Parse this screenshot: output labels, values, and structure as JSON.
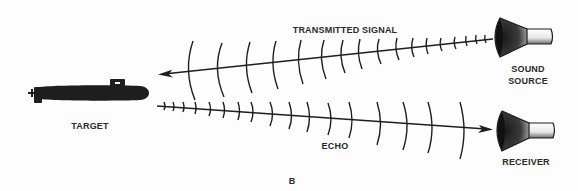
{
  "diagram": {
    "type": "sonar-echo-ranging",
    "panel_label": "B",
    "labels": {
      "transmitted_signal": "TRANSMITTED SIGNAL",
      "sound_source_line1": "SOUND",
      "sound_source_line2": "SOURCE",
      "target": "TARGET",
      "echo": "ECHO",
      "receiver": "RECEIVER"
    },
    "nodes": [
      {
        "id": "target",
        "label": "TARGET",
        "icon": "submarine-icon"
      },
      {
        "id": "sound_source",
        "label": "SOUND SOURCE",
        "icon": "transducer-icon"
      },
      {
        "id": "receiver",
        "label": "RECEIVER",
        "icon": "transducer-icon"
      }
    ],
    "edges": [
      {
        "from": "sound_source",
        "to": "target",
        "label": "TRANSMITTED SIGNAL"
      },
      {
        "from": "target",
        "to": "receiver",
        "label": "ECHO"
      }
    ],
    "colors": {
      "ink": "#1e1e1e",
      "background": "#fdfdfd"
    }
  }
}
